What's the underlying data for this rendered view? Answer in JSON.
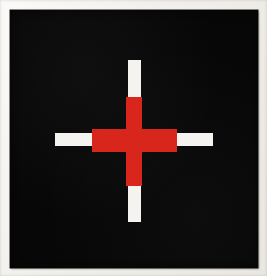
{
  "artwork": {
    "title": "Red and White Cross on Black Ground",
    "form": "plus-sign / cross",
    "medium_appearance": "flat painted panel, photographed",
    "orientation": "upright",
    "symmetry": "four-fold rotational"
  },
  "surround": {
    "name": "paper-surround",
    "color": "#f2f0ed",
    "description": "light off-white margin surrounding the black panel"
  },
  "panel": {
    "name": "black-panel",
    "color": "#070707",
    "left": 10,
    "top": 10,
    "width": 248,
    "height": 258
  },
  "palette": {
    "black": "#070707",
    "red": "#d9261c",
    "white": "#f5f3f0",
    "background": "#f2f0ed"
  },
  "shapes": [
    {
      "name": "cross-vertical-white",
      "color": "#f5f3f0",
      "role": "vertical stroke of the cross, white tips above and below the red core",
      "left": 118,
      "top": 50,
      "width": 13,
      "height": 162
    },
    {
      "name": "cross-horizontal-white",
      "color": "#f5f3f0",
      "role": "horizontal stroke of the cross, white tips left and right of the red core",
      "left": 45,
      "top": 123,
      "width": 158,
      "height": 13
    },
    {
      "name": "cross-vertical-red",
      "color": "#d9261c",
      "role": "red vertical arm, wider than the white stroke, centred on the cross",
      "left": 116,
      "top": 87,
      "width": 16,
      "height": 89
    },
    {
      "name": "cross-horizontal-red",
      "color": "#d9261c",
      "role": "red horizontal arm, taller than the white stroke, centred on the cross",
      "left": 82,
      "top": 119,
      "width": 85,
      "height": 23
    }
  ],
  "composition": {
    "center_x": 124,
    "center_y": 130,
    "note": "the red cross sits inside the longer white cross so each of the four arms ends in a white tip"
  }
}
